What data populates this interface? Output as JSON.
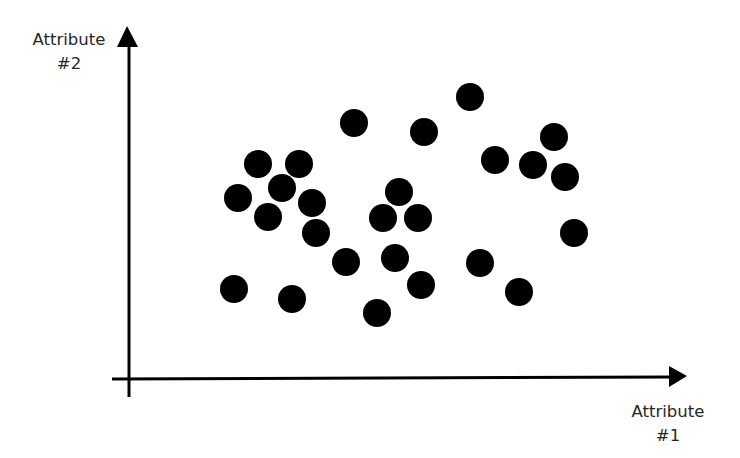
{
  "chart_data": {
    "type": "scatter",
    "title": "",
    "xlabel": "Attribute #1",
    "ylabel": "Attribute #2",
    "xlabel_lines": [
      "Attribute",
      "#1"
    ],
    "ylabel_lines": [
      "Attribute",
      "#2"
    ],
    "grid": false,
    "ticks": false,
    "legend": null,
    "units": "relative (unlabeled axes; pixel offsets from origin)",
    "xlim": [
      0,
      557
    ],
    "ylim": [
      0,
      351
    ],
    "marker": {
      "shape": "circle",
      "color": "#000000",
      "radius": 14
    },
    "axis_color": "#000000",
    "points": [
      {
        "x": 129,
        "y": 214
      },
      {
        "x": 170,
        "y": 214
      },
      {
        "x": 153,
        "y": 190
      },
      {
        "x": 109,
        "y": 180
      },
      {
        "x": 183,
        "y": 175
      },
      {
        "x": 139,
        "y": 161
      },
      {
        "x": 187,
        "y": 145
      },
      {
        "x": 105,
        "y": 89
      },
      {
        "x": 163,
        "y": 79
      },
      {
        "x": 225,
        "y": 255
      },
      {
        "x": 295,
        "y": 246
      },
      {
        "x": 270,
        "y": 186
      },
      {
        "x": 254,
        "y": 160
      },
      {
        "x": 289,
        "y": 160
      },
      {
        "x": 217,
        "y": 116
      },
      {
        "x": 266,
        "y": 120
      },
      {
        "x": 292,
        "y": 93
      },
      {
        "x": 248,
        "y": 65
      },
      {
        "x": 341,
        "y": 281
      },
      {
        "x": 425,
        "y": 241
      },
      {
        "x": 366,
        "y": 218
      },
      {
        "x": 404,
        "y": 213
      },
      {
        "x": 436,
        "y": 201
      },
      {
        "x": 445,
        "y": 145
      },
      {
        "x": 351,
        "y": 115
      },
      {
        "x": 390,
        "y": 86
      }
    ]
  },
  "layout": {
    "origin_px": {
      "x": 129,
      "y": 378
    }
  }
}
